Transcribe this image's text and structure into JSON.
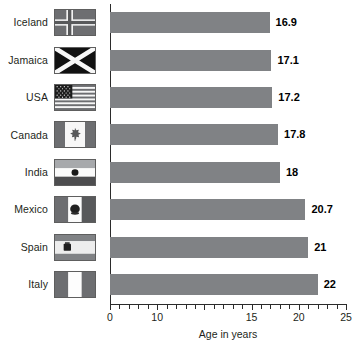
{
  "chart_data": {
    "type": "bar",
    "orientation": "horizontal",
    "title": "",
    "xlabel": "Age in years",
    "ylabel": "",
    "categories": [
      "Iceland",
      "Jamaica",
      "USA",
      "Canada",
      "India",
      "Mexico",
      "Spain",
      "Italy"
    ],
    "values": [
      16.9,
      17.1,
      17.2,
      17.8,
      18,
      20.7,
      21,
      22
    ],
    "value_labels": [
      "16.9",
      "17.1",
      "17.2",
      "17.8",
      "18",
      "20.7",
      "21",
      "22"
    ],
    "xlim": [
      0,
      25
    ],
    "xticks": [
      0,
      5,
      10,
      15,
      20,
      25
    ],
    "xtick_labels": [
      "0",
      "10",
      "",
      "15",
      "20",
      "25"
    ],
    "minor_tick_step": 1,
    "grid": false,
    "legend": null,
    "bar_color": "#808285",
    "axis_color": "#2b2b2b",
    "text_color": "#231f20"
  },
  "rows": [
    {
      "label": "Iceland",
      "value": 16.9,
      "value_label": "16.9",
      "flag": "flag-iceland"
    },
    {
      "label": "Jamaica",
      "value": 17.1,
      "value_label": "17.1",
      "flag": "flag-jamaica"
    },
    {
      "label": "USA",
      "value": 17.2,
      "value_label": "17.2",
      "flag": "flag-usa"
    },
    {
      "label": "Canada",
      "value": 17.8,
      "value_label": "17.8",
      "flag": "flag-canada"
    },
    {
      "label": "India",
      "value": 18,
      "value_label": "18",
      "flag": "flag-india"
    },
    {
      "label": "Mexico",
      "value": 20.7,
      "value_label": "20.7",
      "flag": "flag-mexico"
    },
    {
      "label": "Spain",
      "value": 21,
      "value_label": "21",
      "flag": "flag-spain"
    },
    {
      "label": "Italy",
      "value": 22,
      "value_label": "22",
      "flag": "flag-italy"
    }
  ],
  "axis": {
    "title": "Age in years",
    "ticks": [
      {
        "value": 0,
        "label": "0"
      },
      {
        "value": 5,
        "label": "10"
      },
      {
        "value": 15,
        "label": "15"
      },
      {
        "value": 20,
        "label": "20"
      },
      {
        "value": 25,
        "label": "25"
      }
    ]
  }
}
